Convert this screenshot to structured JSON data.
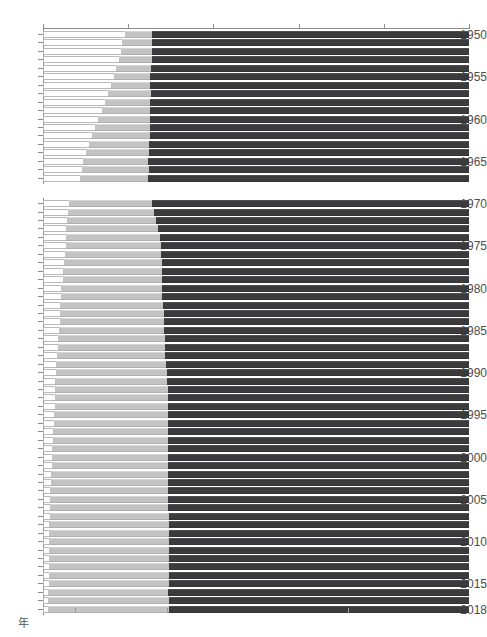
{
  "axis": {
    "top_ticks": [
      {
        "value": 0,
        "label": "0"
      },
      {
        "value": 20,
        "label": "20"
      },
      {
        "value": 40,
        "label": "40"
      },
      {
        "value": 60,
        "label": "60"
      },
      {
        "value": 80,
        "label": "80"
      },
      {
        "value": 100,
        "label": "100%"
      }
    ],
    "bottom_unit_label": "年",
    "bottom_value_labels": [
      {
        "value": 7.45,
        "label": "14.9"
      },
      {
        "value": 29.05,
        "label": "28.3"
      },
      {
        "value": 71.6,
        "label": "56.8"
      }
    ]
  },
  "colors": {
    "primary_sector": "#ffffff",
    "secondary_sector": "#c3c3c3",
    "tertiary_sector": "#3b3b3d",
    "axis": "#8c8c8c",
    "text": "#4e4e4e"
  },
  "chart_data": {
    "type": "bar",
    "title": "",
    "subtitle": "",
    "xlabel": "",
    "ylabel": "年",
    "xlim": [
      0,
      100
    ],
    "grid": false,
    "legend_position": "none",
    "orientation": "horizontal",
    "stacked": true,
    "stack_total": 100,
    "categories": [
      "1950",
      "1951",
      "1952",
      "1953",
      "1954",
      "1955",
      "1956",
      "1957",
      "1958",
      "1959",
      "1960",
      "1961",
      "1962",
      "1963",
      "1964",
      "1965",
      "1966",
      "1967",
      "1970",
      "1971",
      "1972",
      "1973",
      "1974",
      "1975",
      "1976",
      "1977",
      "1978",
      "1979",
      "1980",
      "1981",
      "1982",
      "1983",
      "1984",
      "1985",
      "1986",
      "1987",
      "1988",
      "1989",
      "1990",
      "1991",
      "1992",
      "1993",
      "1994",
      "1995",
      "1996",
      "1997",
      "1998",
      "1999",
      "2000",
      "2001",
      "2002",
      "2003",
      "2004",
      "2005",
      "2006",
      "2007",
      "2008",
      "2009",
      "2010",
      "2011",
      "2012",
      "2013",
      "2014",
      "2015",
      "2016",
      "2017",
      "2018"
    ],
    "year_ticks": [
      "1950",
      "1955",
      "1960",
      "1965",
      "1970",
      "1975",
      "1980",
      "1985",
      "1990",
      "1995",
      "2000",
      "2005",
      "2010",
      "2015",
      "2018"
    ],
    "gap_after_category": "1967",
    "series": [
      {
        "name": "第1次産業",
        "color": "#ffffff",
        "values": [
          19.2,
          18.6,
          18.3,
          17.8,
          17.1,
          16.6,
          15.9,
          15.3,
          14.6,
          13.9,
          13.0,
          12.2,
          11.5,
          10.8,
          10.0,
          9.5,
          9.1,
          8.6,
          6.1,
          5.9,
          5.7,
          5.5,
          5.4,
          5.3,
          5.1,
          5.0,
          4.8,
          4.6,
          4.3,
          4.2,
          4.1,
          4.0,
          3.9,
          3.7,
          3.6,
          3.5,
          3.3,
          3.1,
          3.0,
          2.9,
          2.8,
          2.8,
          2.7,
          2.6,
          2.5,
          2.4,
          2.3,
          2.2,
          2.1,
          2.0,
          1.9,
          1.8,
          1.7,
          1.7,
          1.6,
          1.6,
          1.5,
          1.5,
          1.5,
          1.4,
          1.4,
          1.4,
          1.3,
          1.3,
          1.2,
          1.2,
          1.2
        ]
      },
      {
        "name": "第2次産業",
        "color": "#c3c3c3",
        "values": [
          6.3,
          7.0,
          7.2,
          7.7,
          8.2,
          8.6,
          9.3,
          10.0,
          10.5,
          11.2,
          12.2,
          13.0,
          13.6,
          14.1,
          14.8,
          15.2,
          15.7,
          16.1,
          19.6,
          20.2,
          20.8,
          21.5,
          22.0,
          22.3,
          22.7,
          23.0,
          23.2,
          23.4,
          23.6,
          23.8,
          24.1,
          24.3,
          24.5,
          24.8,
          25.0,
          25.2,
          25.4,
          25.7,
          26.0,
          26.3,
          26.5,
          26.6,
          26.7,
          26.8,
          26.9,
          27.0,
          27.0,
          27.1,
          27.2,
          27.3,
          27.4,
          27.5,
          27.6,
          27.7,
          27.8,
          27.9,
          28.0,
          28.0,
          28.1,
          28.1,
          28.1,
          28.2,
          28.2,
          28.2,
          28.2,
          28.3,
          28.3
        ]
      },
      {
        "name": "第3次産業",
        "color": "#3b3b3d",
        "values": [
          74.5,
          74.4,
          74.5,
          74.5,
          74.7,
          74.8,
          74.8,
          74.7,
          74.9,
          74.9,
          74.8,
          74.8,
          74.9,
          75.1,
          75.2,
          75.3,
          75.2,
          75.3,
          74.3,
          73.9,
          73.5,
          73.0,
          72.6,
          72.4,
          72.2,
          72.0,
          72.0,
          72.0,
          72.1,
          72.0,
          71.8,
          71.7,
          71.6,
          71.5,
          71.4,
          71.3,
          71.3,
          71.2,
          71.0,
          70.8,
          70.7,
          70.6,
          70.6,
          70.6,
          70.6,
          70.6,
          70.7,
          70.7,
          70.7,
          70.7,
          70.7,
          70.7,
          70.7,
          70.6,
          70.6,
          70.5,
          70.5,
          70.5,
          70.4,
          70.5,
          70.5,
          70.4,
          70.5,
          70.5,
          70.6,
          70.5,
          70.5
        ]
      }
    ],
    "labeled_values_2018": {
      "primary": 14.9,
      "secondary": 28.3,
      "tertiary": 56.8
    }
  }
}
